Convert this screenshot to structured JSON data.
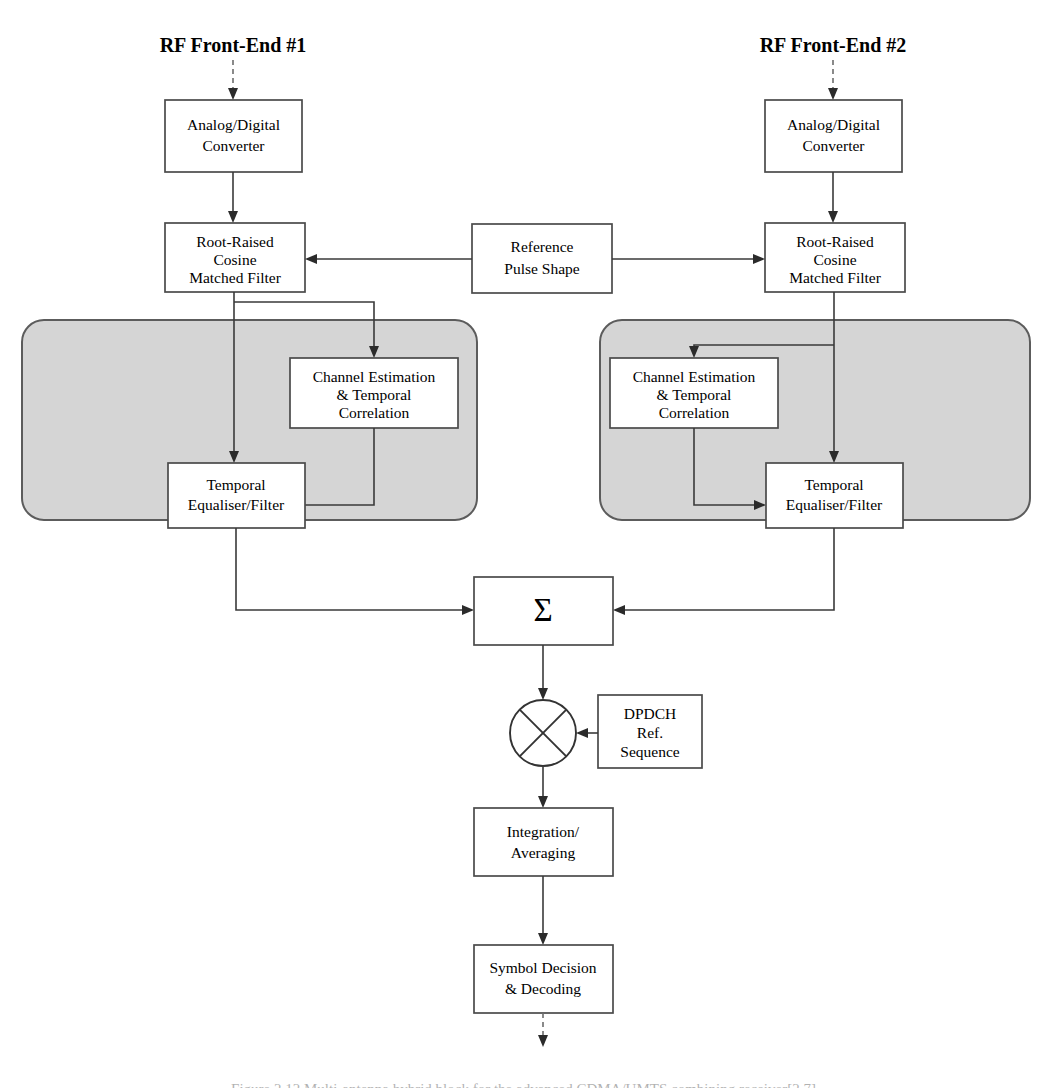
{
  "figure": {
    "type": "block-diagram",
    "headers": [
      {
        "id": "rf1",
        "label": "RF Front-End #1"
      },
      {
        "id": "rf2",
        "label": "RF Front-End #2"
      }
    ],
    "blocks": {
      "adc_left": "Analog/Digital\nConverter",
      "adc_left_l1": "Analog/Digital",
      "adc_left_l2": "Converter",
      "adc_right_l1": "Analog/Digital",
      "adc_right_l2": "Converter",
      "rrc_left_l1": "Root-Raised",
      "rrc_left_l2": "Cosine",
      "rrc_left_l3": "Matched Filter",
      "rrc_right_l1": "Root-Raised",
      "rrc_right_l2": "Cosine",
      "rrc_right_l3": "Matched Filter",
      "reference_l1": "Reference",
      "reference_l2": "Pulse Shape",
      "chest_left_l1": "Channel Estimation",
      "chest_left_l2": "& Temporal",
      "chest_left_l3": "Correlation",
      "chest_right_l1": "Channel Estimation",
      "chest_right_l2": "& Temporal",
      "chest_right_l3": "Correlation",
      "teq_left_l1": "Temporal",
      "teq_left_l2": "Equaliser/Filter",
      "teq_right_l1": "Temporal",
      "teq_right_l2": "Equaliser/Filter",
      "summation": "Σ",
      "dpdch_l1": "DPDCH",
      "dpdch_l2": "Ref.",
      "dpdch_l3": "Sequence",
      "integration_l1": "Integration/",
      "integration_l2": "Averaging",
      "symbol_l1": "Symbol Decision",
      "symbol_l2": "& Decoding"
    },
    "caption": "Figure 2.12   Multi-antenna hybrid block for the advanced CDMA/UMTS combining receiver[2.7]",
    "colors": {
      "panel_fill": "#d5d5d5",
      "panel_stroke": "#5c5c5c",
      "box_fill": "#ffffff",
      "box_stroke": "#4a4a4a",
      "wire": "#3a3a3a",
      "text": "#000000",
      "background": "#ffffff"
    }
  }
}
